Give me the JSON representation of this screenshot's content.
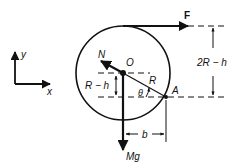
{
  "diagram": {
    "axes": {
      "x_label": "x",
      "y_label": "y"
    },
    "labels": {
      "force_F": "F",
      "normal_N": "N",
      "center_O": "O",
      "radius_R": "R",
      "angle_theta": "θ",
      "contact_A": "A",
      "weight_Mg": "Mg",
      "dim_b": "b",
      "dim_R_minus_h": "R − h",
      "dim_2R_minus_h": "2R − h"
    },
    "colors": {
      "ink": "#111111",
      "background": "#ffffff"
    }
  }
}
